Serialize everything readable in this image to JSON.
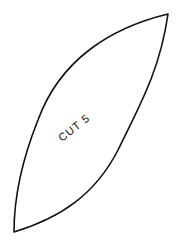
{
  "pattern_piece": {
    "label": "CUT 5",
    "stroke_color": "#111111",
    "fill_color": "#ffffff"
  }
}
